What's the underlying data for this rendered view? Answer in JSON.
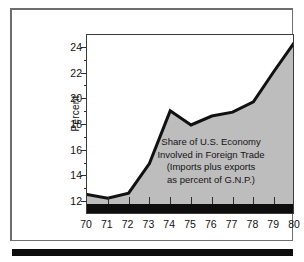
{
  "figure": {
    "y_axis_title": "Percent",
    "annotation_lines": [
      "Share of U.S. Economy",
      "Involved in Foreign Trade",
      "(Imports plus exports",
      "as percent of G.N.P.)"
    ]
  },
  "colors": {
    "area_fill": "#bdbdbd",
    "line": "#111111",
    "baseline_band": "#0d0d0d",
    "plot_border": "#3a3a3a",
    "figure_frame": "#6e6e6e",
    "page_background": "#ffffff",
    "text": "#111111"
  },
  "chart_data": {
    "type": "area",
    "subtitle": "(Imports plus exports as percent of G.N.P.)",
    "xlabel": "",
    "ylabel": "Percent",
    "x": [
      70,
      71,
      72,
      73,
      74,
      75,
      76,
      77,
      78,
      79,
      80
    ],
    "categories": [
      "70",
      "71",
      "72",
      "73",
      "74",
      "75",
      "76",
      "77",
      "78",
      "79",
      "80"
    ],
    "values": [
      12.6,
      12.3,
      12.7,
      15.0,
      19.1,
      18.0,
      18.7,
      19.0,
      19.8,
      22.2,
      24.5
    ],
    "xlim": [
      70,
      80
    ],
    "ylim": [
      11.0,
      25.0
    ],
    "ytick_major": [
      12,
      14,
      16,
      18,
      20,
      22,
      24
    ],
    "ytick_major_labels": [
      "12",
      "14",
      "16",
      "18",
      "20",
      "22",
      "24"
    ],
    "ytick_minor": [
      13,
      15,
      17,
      19,
      21,
      23
    ],
    "xtick_labels": [
      "70",
      "71",
      "72",
      "73",
      "74",
      "75",
      "76",
      "77",
      "78",
      "79",
      "80"
    ],
    "grid": false,
    "legend": "none",
    "annotations": [
      {
        "text": "Share of U.S. Economy Involved in Foreign Trade (Imports plus exports as percent of G.N.P.)",
        "x": 76.5,
        "y": 15.5
      }
    ]
  }
}
